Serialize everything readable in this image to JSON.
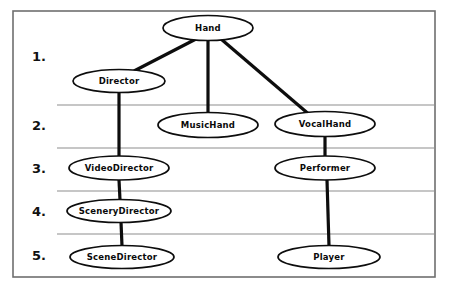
{
  "figure": {
    "type": "class-hierarchy-diagram",
    "frame": {
      "x": 13,
      "y": 11,
      "width": 422,
      "height": 266
    },
    "colors": {
      "background": "#ffffff",
      "node_fill": "#ffffff",
      "node_stroke": "#0d0d0d",
      "edge": "#0d0d0d",
      "divider": "#8e8e8e",
      "frame": "#6f6f6f",
      "text": "#0a0a0a"
    }
  },
  "row_labels": [
    {
      "text": "1.",
      "x": 32,
      "y": 57
    },
    {
      "text": "2.",
      "x": 32,
      "y": 126
    },
    {
      "text": "3.",
      "x": 32,
      "y": 169
    },
    {
      "text": "4.",
      "x": 32,
      "y": 212
    },
    {
      "text": "5.",
      "x": 32,
      "y": 256
    }
  ],
  "dividers": [
    {
      "x1": 57,
      "y1": 105,
      "x2": 435,
      "y2": 105
    },
    {
      "x1": 57,
      "y1": 148,
      "x2": 435,
      "y2": 148
    },
    {
      "x1": 57,
      "y1": 191,
      "x2": 435,
      "y2": 191
    },
    {
      "x1": 57,
      "y1": 234,
      "x2": 435,
      "y2": 234
    }
  ],
  "nodes": [
    {
      "id": "hand",
      "label": "Hand",
      "cx": 208,
      "cy": 28,
      "rx": 45,
      "ry": 12.5,
      "level": 1
    },
    {
      "id": "director",
      "label": "Director",
      "cx": 119,
      "cy": 81,
      "rx": 46,
      "ry": 11.5,
      "level": 1
    },
    {
      "id": "musichand",
      "label": "MusicHand",
      "cx": 208,
      "cy": 125,
      "rx": 50,
      "ry": 12.5,
      "level": 2
    },
    {
      "id": "vocalhand",
      "label": "VocalHand",
      "cx": 325,
      "cy": 124,
      "rx": 50,
      "ry": 12.5,
      "level": 2
    },
    {
      "id": "videodirector",
      "label": "VideoDirector",
      "cx": 119,
      "cy": 168,
      "rx": 50,
      "ry": 12.0,
      "level": 3
    },
    {
      "id": "performer",
      "label": "Performer",
      "cx": 325,
      "cy": 168,
      "rx": 50,
      "ry": 12.0,
      "level": 3
    },
    {
      "id": "scenerydirector",
      "label": "SceneryDirector",
      "cx": 119,
      "cy": 211,
      "rx": 52,
      "ry": 11.5,
      "level": 4
    },
    {
      "id": "scenedirector",
      "label": "SceneDirector",
      "cx": 122,
      "cy": 257,
      "rx": 52,
      "ry": 11.5,
      "level": 5
    },
    {
      "id": "player",
      "label": "Player",
      "cx": 329,
      "cy": 257,
      "rx": 51,
      "ry": 11.5,
      "level": 5
    }
  ],
  "edges": [
    {
      "from": "hand",
      "to": "director",
      "x1": 196,
      "y1": 39,
      "x2": 134,
      "y2": 71
    },
    {
      "from": "hand",
      "to": "musichand",
      "x1": 208,
      "y1": 40,
      "x2": 208,
      "y2": 113
    },
    {
      "from": "hand",
      "to": "vocalhand",
      "x1": 221,
      "y1": 39,
      "x2": 311,
      "y2": 116
    },
    {
      "from": "director",
      "to": "videodirector",
      "x1": 119,
      "y1": 92,
      "x2": 119,
      "y2": 157
    },
    {
      "from": "vocalhand",
      "to": "performer",
      "x1": 325,
      "y1": 136,
      "x2": 325,
      "y2": 157
    },
    {
      "from": "videodirector",
      "to": "scenerydirector",
      "x1": 119,
      "y1": 180,
      "x2": 120,
      "y2": 200
    },
    {
      "from": "scenerydirector",
      "to": "scenedirector",
      "x1": 121,
      "y1": 222,
      "x2": 122,
      "y2": 246
    },
    {
      "from": "performer",
      "to": "player",
      "x1": 327,
      "y1": 180,
      "x2": 329,
      "y2": 246
    }
  ]
}
